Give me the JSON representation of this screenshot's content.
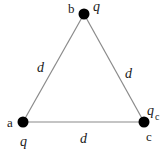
{
  "diagram": {
    "type": "equilateral-triangle-charges",
    "nodes": [
      {
        "id": "a",
        "label": "a",
        "charge": "q",
        "x": 23,
        "y": 122
      },
      {
        "id": "b",
        "label": "b",
        "charge": "q",
        "x": 84,
        "y": 14
      },
      {
        "id": "c",
        "label": "c",
        "charge": "q",
        "charge_sub": "c",
        "x": 144,
        "y": 122
      }
    ],
    "edges": [
      {
        "from": "a",
        "to": "b",
        "label": "d"
      },
      {
        "from": "b",
        "to": "c",
        "label": "d"
      },
      {
        "from": "a",
        "to": "c",
        "label": "d"
      }
    ],
    "colors": {
      "line": "#8a8a8a",
      "node": "#000000",
      "text": "#1a1a1a"
    }
  }
}
